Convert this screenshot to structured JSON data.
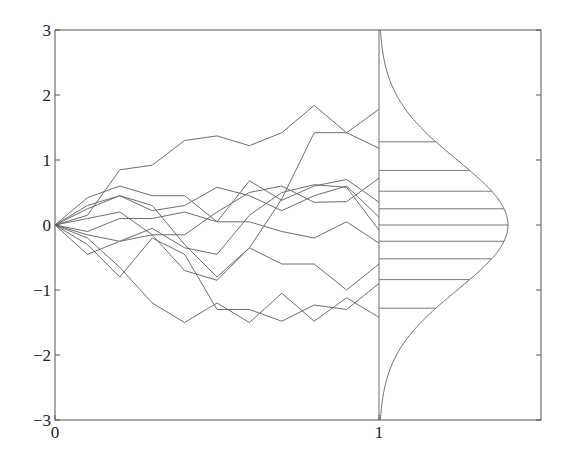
{
  "chart_data": {
    "type": "line",
    "title": "",
    "xlabel": "",
    "ylabel": "",
    "xlim": [
      0,
      1.67
    ],
    "ylim": [
      -3,
      3
    ],
    "grid": false,
    "legend": null,
    "x_ticks": [
      0,
      1
    ],
    "x_tick_labels": [
      "0",
      "1"
    ],
    "y_ticks": [
      3,
      2,
      1,
      0,
      -1,
      -2,
      -3
    ],
    "y_tick_labels": [
      "3",
      "2",
      "1",
      "0",
      "−1",
      "−2",
      "−3"
    ],
    "x": [
      0,
      0.1,
      0.2,
      0.3,
      0.4,
      0.5,
      0.6,
      0.7,
      0.8,
      0.9,
      1.0
    ],
    "series": [
      {
        "name": "path-1",
        "values": [
          0,
          0.15,
          0.85,
          0.92,
          1.3,
          1.37,
          1.22,
          1.42,
          1.84,
          1.42,
          1.18
        ]
      },
      {
        "name": "path-2",
        "values": [
          0,
          0.3,
          0.45,
          0.3,
          -0.3,
          -0.8,
          -0.35,
          0.4,
          1.42,
          1.42,
          1.78
        ]
      },
      {
        "name": "path-3",
        "values": [
          0,
          0.42,
          0.6,
          0.45,
          0.45,
          0.05,
          0.68,
          0.38,
          0.6,
          0.7,
          0.35
        ]
      },
      {
        "name": "path-4",
        "values": [
          0,
          0.25,
          0.45,
          0.22,
          0.3,
          0.58,
          0.45,
          0.22,
          0.45,
          0.6,
          0.12
        ]
      },
      {
        "name": "path-5",
        "values": [
          0,
          0.1,
          0.2,
          -0.15,
          -0.15,
          0.2,
          0.5,
          0.6,
          0.35,
          0.36,
          0.72
        ]
      },
      {
        "name": "path-6",
        "values": [
          0,
          -0.1,
          0.1,
          0.1,
          0.2,
          0.05,
          0.05,
          -0.1,
          -0.2,
          0.05,
          -0.28
        ]
      },
      {
        "name": "path-7",
        "values": [
          0,
          -0.15,
          -0.25,
          -0.05,
          -0.35,
          -0.45,
          0.15,
          0.5,
          0.62,
          0.58,
          -0.08
        ]
      },
      {
        "name": "path-8",
        "values": [
          0,
          -0.45,
          -0.25,
          -0.15,
          -0.7,
          -0.85,
          -0.35,
          -0.6,
          -0.6,
          -1.0,
          -0.6
        ]
      },
      {
        "name": "path-9",
        "values": [
          0,
          -0.3,
          -0.8,
          -0.2,
          -0.45,
          -1.3,
          -1.3,
          -1.48,
          -1.23,
          -1.3,
          -0.9
        ]
      },
      {
        "name": "path-10",
        "values": [
          0,
          -0.2,
          -0.65,
          -1.2,
          -1.5,
          -1.2,
          -1.5,
          -1.05,
          -1.48,
          -1.12,
          -1.42
        ]
      }
    ],
    "terminal_density": {
      "type": "gaussian",
      "mean": 0,
      "std": 1,
      "x_offset": 1.0,
      "peak_width": 0.4,
      "y_range": [
        -3,
        3
      ]
    },
    "quantile_lines": [
      1.28,
      0.84,
      0.52,
      0.25,
      0,
      -0.25,
      -0.52,
      -0.84,
      -1.28
    ],
    "vertical_line_at_x": 1.0
  }
}
